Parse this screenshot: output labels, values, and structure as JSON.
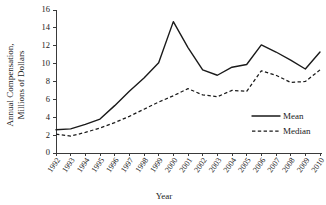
{
  "chart_data": {
    "type": "line",
    "title": "",
    "xlabel": "Year",
    "ylabel": "Annual Compensation, Millions of Dollars",
    "ylabel_line1": "Annual Compensation,",
    "ylabel_line2": "Millions of Dollars",
    "categories": [
      "1992",
      "1993",
      "1994",
      "1995",
      "1996",
      "1997",
      "1998",
      "1999",
      "2000",
      "2001",
      "2002",
      "2003",
      "2004",
      "2005",
      "2006",
      "2007",
      "2008",
      "2009",
      "2010"
    ],
    "yticks": [
      0,
      2,
      4,
      6,
      8,
      10,
      12,
      14,
      16
    ],
    "ylim": [
      0,
      16
    ],
    "xlim": [
      "1992",
      "2010"
    ],
    "grid": false,
    "legend_position": "inside-right-lower",
    "series": [
      {
        "name": "Mean",
        "style": "solid",
        "color": "#1a1a1a",
        "values": [
          2.6,
          2.7,
          3.2,
          3.8,
          5.3,
          6.9,
          8.4,
          10.1,
          14.7,
          11.8,
          9.3,
          8.7,
          9.6,
          9.9,
          12.1,
          11.3,
          10.4,
          9.4,
          11.3
        ]
      },
      {
        "name": "Median",
        "style": "dashed",
        "color": "#1a1a1a",
        "values": [
          2.1,
          1.9,
          2.3,
          2.8,
          3.4,
          4.1,
          4.9,
          5.7,
          6.4,
          7.2,
          6.5,
          6.3,
          7.0,
          6.9,
          9.2,
          8.7,
          7.9,
          8.0,
          9.3
        ]
      }
    ]
  },
  "legend": {
    "entries": [
      {
        "label": "Mean",
        "style": "solid"
      },
      {
        "label": "Median",
        "style": "dashed"
      }
    ]
  },
  "axes": {
    "x_title": "Year",
    "y_title_line1": "Annual Compensation,",
    "y_title_line2": "Millions of Dollars"
  }
}
